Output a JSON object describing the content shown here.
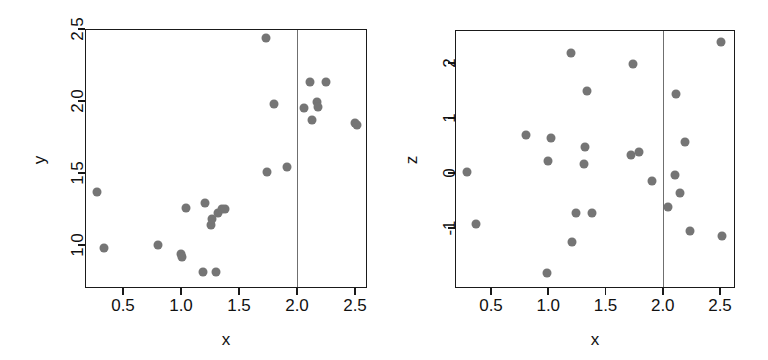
{
  "figure": {
    "panel_count": 2,
    "point_color": "#757575",
    "axis_color": "#1a1a1a",
    "refline_color": "#6f6f6f",
    "background": "#ffffff"
  },
  "chart_data": [
    {
      "type": "scatter",
      "title": "",
      "xlabel": "x",
      "ylabel": "y",
      "xlim": [
        0.22,
        2.62
      ],
      "ylim": [
        0.76,
        2.55
      ],
      "xticks": [
        0.5,
        1.0,
        1.5,
        2.0,
        2.5
      ],
      "xticklabels": [
        "0.5",
        "1.0",
        "1.5",
        "2.0",
        "2.5"
      ],
      "yticks": [
        1.0,
        1.5,
        2.0,
        2.5
      ],
      "yticklabels": [
        "1.0",
        "1.5",
        "2.0",
        "2.5"
      ],
      "grid": false,
      "legend": "none",
      "annotations": [
        {
          "kind": "vertical-reference-line",
          "x": 2.0
        }
      ],
      "points": [
        {
          "x": 0.28,
          "y": 1.37
        },
        {
          "x": 0.34,
          "y": 0.98
        },
        {
          "x": 0.8,
          "y": 1.0
        },
        {
          "x": 1.0,
          "y": 0.94
        },
        {
          "x": 1.01,
          "y": 0.92
        },
        {
          "x": 1.04,
          "y": 1.26
        },
        {
          "x": 1.19,
          "y": 0.81
        },
        {
          "x": 1.21,
          "y": 1.29
        },
        {
          "x": 1.26,
          "y": 1.14
        },
        {
          "x": 1.27,
          "y": 1.18
        },
        {
          "x": 1.3,
          "y": 0.81
        },
        {
          "x": 1.32,
          "y": 1.22
        },
        {
          "x": 1.35,
          "y": 1.25
        },
        {
          "x": 1.38,
          "y": 1.25
        },
        {
          "x": 1.73,
          "y": 2.44
        },
        {
          "x": 1.74,
          "y": 1.51
        },
        {
          "x": 1.8,
          "y": 1.98
        },
        {
          "x": 1.91,
          "y": 1.54
        },
        {
          "x": 2.06,
          "y": 1.95
        },
        {
          "x": 2.11,
          "y": 2.13
        },
        {
          "x": 2.13,
          "y": 1.87
        },
        {
          "x": 2.17,
          "y": 1.99
        },
        {
          "x": 2.18,
          "y": 1.96
        },
        {
          "x": 2.25,
          "y": 2.13
        },
        {
          "x": 2.5,
          "y": 1.85
        },
        {
          "x": 2.52,
          "y": 1.83
        }
      ]
    },
    {
      "type": "scatter",
      "title": "",
      "xlabel": "x",
      "ylabel": "z",
      "xlim": [
        0.22,
        2.62
      ],
      "ylim": [
        -1.85,
        2.55
      ],
      "xticks": [
        0.5,
        1.0,
        1.5,
        2.0,
        2.5
      ],
      "xticklabels": [
        "0.5",
        "1.0",
        "1.5",
        "2.0",
        "2.5"
      ],
      "yticks": [
        -1,
        0,
        1,
        2
      ],
      "yticklabels": [
        "-1",
        "0",
        "1",
        "2"
      ],
      "grid": false,
      "legend": "none",
      "annotations": [
        {
          "kind": "vertical-reference-line",
          "x": 2.0
        }
      ],
      "points": [
        {
          "x": 0.29,
          "y": 0.02
        },
        {
          "x": 0.37,
          "y": -0.92
        },
        {
          "x": 0.81,
          "y": 0.7
        },
        {
          "x": 0.99,
          "y": -1.82
        },
        {
          "x": 1.0,
          "y": 0.21
        },
        {
          "x": 1.02,
          "y": 0.63
        },
        {
          "x": 1.2,
          "y": 2.18
        },
        {
          "x": 1.21,
          "y": -1.25
        },
        {
          "x": 1.24,
          "y": -0.72
        },
        {
          "x": 1.31,
          "y": 0.17
        },
        {
          "x": 1.32,
          "y": 0.47
        },
        {
          "x": 1.34,
          "y": 1.5
        },
        {
          "x": 1.38,
          "y": -0.73
        },
        {
          "x": 1.72,
          "y": 0.33
        },
        {
          "x": 1.74,
          "y": 1.99
        },
        {
          "x": 1.79,
          "y": 0.38
        },
        {
          "x": 1.91,
          "y": -0.14
        },
        {
          "x": 2.05,
          "y": -0.62
        },
        {
          "x": 2.11,
          "y": -0.03
        },
        {
          "x": 2.12,
          "y": 1.44
        },
        {
          "x": 2.15,
          "y": -0.37
        },
        {
          "x": 2.19,
          "y": 0.57
        },
        {
          "x": 2.24,
          "y": -1.05
        },
        {
          "x": 2.51,
          "y": 2.38
        },
        {
          "x": 2.52,
          "y": -1.14
        }
      ]
    }
  ]
}
